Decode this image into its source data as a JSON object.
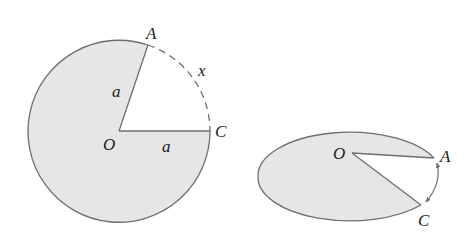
{
  "figure_left": {
    "title": "Circle with sector removed",
    "shape": "circle",
    "center": {
      "x": 119,
      "y": 131
    },
    "radius": 91,
    "labels": {
      "A": "A",
      "C": "C",
      "O": "O",
      "radius_oa": "a",
      "radius_oc": "a",
      "arc": "x"
    },
    "arc_style": "dashed"
  },
  "figure_right": {
    "title": "Cone formed by joining OA and OC",
    "shape": "ellipse",
    "labels": {
      "A": "A",
      "C": "C",
      "O": "O"
    },
    "arrow": "double-headed curved arrow between A and C"
  },
  "colors": {
    "fill": "#e6e6e6",
    "stroke": "#6e6e6e",
    "text": "#1a1a1a"
  }
}
